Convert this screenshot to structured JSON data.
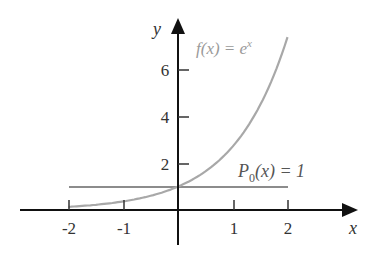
{
  "chart_data": {
    "type": "line",
    "title": "",
    "xlabel": "x",
    "ylabel": "y",
    "xlim": [
      -2,
      2
    ],
    "ylim": [
      0,
      7.4
    ],
    "x_ticks": [
      "-2",
      "-1",
      "1",
      "2"
    ],
    "y_ticks": [
      "2",
      "4",
      "6"
    ],
    "grid": false,
    "series": [
      {
        "name": "f(x) = e^x",
        "color": "#a8a8a8",
        "x": [
          -2,
          -1.5,
          -1,
          -0.5,
          0,
          0.5,
          1,
          1.5,
          2
        ],
        "values": [
          0.135,
          0.223,
          0.368,
          0.607,
          1.0,
          1.649,
          2.718,
          4.482,
          7.389
        ]
      },
      {
        "name": "P0(x) = 1",
        "color": "#8c8c8c",
        "x": [
          -2,
          2
        ],
        "values": [
          1,
          1
        ]
      }
    ],
    "annotations": [
      {
        "text": "f(x) = e^x",
        "near": [
          0.3,
          6.9
        ]
      },
      {
        "text": "P0(x) = 1",
        "near": [
          1.2,
          1.9
        ]
      }
    ]
  },
  "labels": {
    "x_axis": "x",
    "y_axis": "y",
    "xtick_m2": "-2",
    "xtick_m1": "-1",
    "xtick_1": "1",
    "xtick_2": "2",
    "ytick_2": "2",
    "ytick_4": "4",
    "ytick_6": "6",
    "f_label_main": "f(x) = e",
    "f_label_sup": "x",
    "p_label_P": "P",
    "p_label_sub": "0",
    "p_label_rest": "(x) = 1"
  }
}
